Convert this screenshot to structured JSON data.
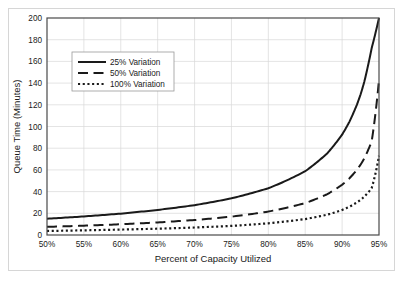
{
  "chart_data": {
    "type": "line",
    "title": "",
    "xlabel": "Percent of Capacity Utilized",
    "ylabel": "Queue Time (Minutes)",
    "xlim": [
      50,
      95
    ],
    "ylim": [
      0,
      200
    ],
    "xticks": [
      "50%",
      "55%",
      "60%",
      "65%",
      "70%",
      "75%",
      "80%",
      "85%",
      "90%",
      "95%"
    ],
    "xtick_values": [
      50,
      55,
      60,
      65,
      70,
      75,
      80,
      85,
      90,
      95
    ],
    "yticks": [
      "0",
      "20",
      "40",
      "60",
      "80",
      "100",
      "120",
      "140",
      "160",
      "180",
      "200"
    ],
    "ytick_values": [
      0,
      20,
      40,
      60,
      80,
      100,
      120,
      140,
      160,
      180,
      200
    ],
    "grid": true,
    "legend_position": "upper-left-inside",
    "x": [
      50,
      55,
      60,
      65,
      70,
      75,
      80,
      85,
      88,
      90,
      91,
      92,
      92.5,
      93,
      94,
      95
    ],
    "series": [
      {
        "name": "25% Variation",
        "style": "solid",
        "color": "#1a1a1a",
        "values": [
          15.0,
          17.1,
          19.7,
          23.1,
          27.5,
          33.8,
          43.1,
          58.8,
          75.4,
          92.5,
          104.5,
          120.0,
          129.5,
          141.0,
          172.0,
          200.0
        ]
      },
      {
        "name": "50% Variation",
        "style": "dashed",
        "color": "#1a1a1a",
        "values": [
          7.5,
          8.6,
          9.9,
          11.6,
          13.8,
          16.9,
          21.6,
          29.4,
          37.7,
          46.3,
          52.3,
          60.0,
          64.8,
          70.5,
          86.0,
          143.0
        ]
      },
      {
        "name": "100% Variation",
        "style": "dotted",
        "color": "#1a1a1a",
        "values": [
          3.7,
          4.3,
          5.0,
          5.8,
          6.9,
          8.4,
          10.8,
          14.7,
          18.8,
          23.1,
          26.1,
          30.0,
          32.4,
          35.3,
          43.0,
          73.0
        ]
      }
    ]
  },
  "legend": {
    "items": [
      {
        "label": "25% Variation"
      },
      {
        "label": "50% Variation"
      },
      {
        "label": "100% Variation"
      }
    ]
  },
  "colors": {
    "curve": "#1a1a1a",
    "grid": "#d9d9d9",
    "frame": "#4a4a4a",
    "figure_border": "#d6d6d6",
    "background": "#ffffff"
  }
}
